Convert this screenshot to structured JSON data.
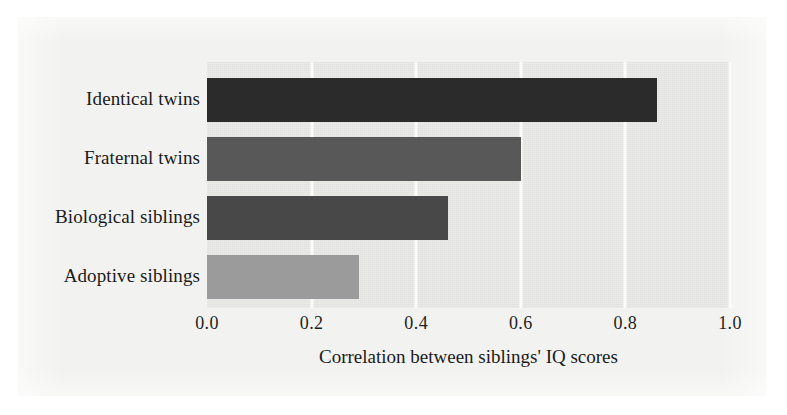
{
  "chart_data": {
    "type": "bar",
    "orientation": "horizontal",
    "title": "",
    "xlabel": "Correlation between siblings' IQ scores",
    "ylabel": "",
    "categories": [
      "Identical twins",
      "Fraternal twins",
      "Biological siblings",
      "Adoptive siblings"
    ],
    "values": [
      0.86,
      0.6,
      0.46,
      0.29
    ],
    "bar_colors": [
      "#2b2b2b",
      "#585858",
      "#484848",
      "#9b9b9b"
    ],
    "xlim": [
      0.0,
      1.0
    ],
    "xticks": [
      0.0,
      0.2,
      0.4,
      0.6,
      0.8,
      1.0
    ],
    "xtick_labels": [
      "0.0",
      "0.2",
      "0.4",
      "0.6",
      "0.8",
      "1.0"
    ],
    "grid": true,
    "grid_axis": "x",
    "grid_color": "#fbfbfa",
    "plot_background": "#e1e1df",
    "page_background": "#f2f2f0",
    "legend": null,
    "legend_position": "none",
    "annotations": []
  },
  "series": [
    {
      "label": "Identical twins",
      "value": 0.86,
      "color": "#2b2b2b"
    },
    {
      "label": "Fraternal twins",
      "value": 0.6,
      "color": "#585858"
    },
    {
      "label": "Biological siblings",
      "value": 0.46,
      "color": "#484848"
    },
    {
      "label": "Adoptive siblings",
      "value": 0.29,
      "color": "#9b9b9b"
    }
  ]
}
